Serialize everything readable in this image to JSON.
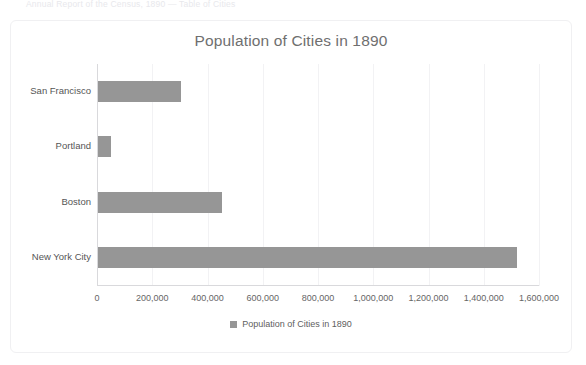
{
  "page": {
    "top_caption": "Annual Report of the Census, 1890 — Table of Cities"
  },
  "chart": {
    "title": "Population of Cities in 1890",
    "legend_label": "Population of Cities in 1890",
    "legend_marker": "square-marker",
    "bar_color": "#969696",
    "gridline_color": "#f2f2f4",
    "axis_color": "#d9d9dc",
    "title_color": "#6f6f6f",
    "frame_color": "#f0f0f2"
  },
  "chart_data": {
    "type": "bar",
    "orientation": "horizontal",
    "title": "Population of Cities in 1890",
    "xlabel": "",
    "ylabel": "",
    "categories": [
      "San Francisco",
      "Portland",
      "Boston",
      "New York City"
    ],
    "values": [
      298997,
      46385,
      448477,
      1515301
    ],
    "series": [
      {
        "name": "Population of Cities in 1890",
        "values": [
          298997,
          46385,
          448477,
          1515301
        ],
        "color": "#969696"
      }
    ],
    "xlim": [
      0,
      1600000
    ],
    "xticks": [
      0,
      200000,
      400000,
      600000,
      800000,
      1000000,
      1200000,
      1400000,
      1600000
    ],
    "xtick_labels": [
      "0",
      "200,000",
      "400,000",
      "600,000",
      "800,000",
      "1,000,000",
      "1,200,000",
      "1,400,000",
      "1,600,000"
    ],
    "grid": true,
    "grid_axis": "x",
    "legend": true,
    "legend_position": "bottom"
  }
}
